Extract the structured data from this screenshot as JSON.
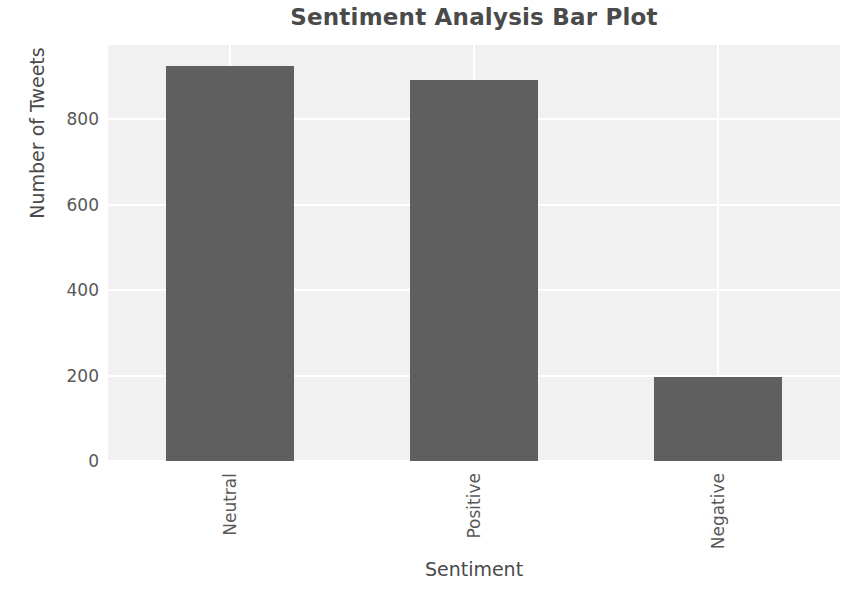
{
  "chart_data": {
    "type": "bar",
    "title": "Sentiment Analysis Bar Plot",
    "xlabel": "Sentiment",
    "ylabel": "Number of Tweets",
    "categories": [
      "Neutral",
      "Positive",
      "Negative"
    ],
    "values": [
      924,
      893,
      196
    ],
    "ytick_labels": [
      "0",
      "200",
      "400",
      "600",
      "800"
    ],
    "ytick_values": [
      0,
      200,
      400,
      600,
      800
    ],
    "ylim": [
      0,
      974
    ],
    "xlim": [
      -0.5,
      2.5
    ],
    "grid": true,
    "grid_color": "#ffffff",
    "legend": null,
    "bar_color": "#5f5f5f",
    "plot_background": "#f1f1f1",
    "figure_background": "#ffffff",
    "text_color": "#4a4a4a",
    "xtick_rotation": 90,
    "bar_width_fraction": 0.525
  },
  "chart": {
    "title": "Sentiment Analysis Bar Plot",
    "axis_x_title": "Sentiment",
    "axis_y_title": "Number of Tweets"
  }
}
